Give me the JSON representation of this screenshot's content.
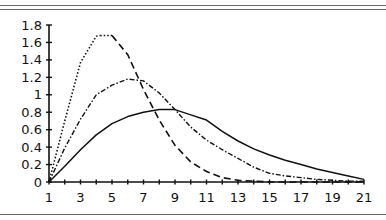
{
  "chart_data": {
    "type": "line",
    "title": "",
    "xlabel": "",
    "ylabel": "",
    "xlim": [
      1,
      21
    ],
    "ylim": [
      0,
      1.8
    ],
    "grid": false,
    "legend": "none",
    "x_ticks": [
      1,
      2,
      3,
      4,
      5,
      6,
      7,
      8,
      9,
      10,
      11,
      12,
      13,
      14,
      15,
      16,
      17,
      18,
      19,
      20,
      21
    ],
    "x_tick_labels": [
      "1",
      "3",
      "5",
      "7",
      "9",
      "11",
      "13",
      "15",
      "17",
      "19",
      "21"
    ],
    "x_tick_label_values": [
      1,
      3,
      5,
      7,
      9,
      11,
      13,
      15,
      17,
      19,
      21
    ],
    "y_tick_labels": [
      "0",
      "0.2",
      "0.4",
      "0.6",
      "0.8",
      "1",
      "1.2",
      "1.4",
      "1.6",
      "1.8"
    ],
    "y_tick_values": [
      0,
      0.2,
      0.4,
      0.6,
      0.8,
      1.0,
      1.2,
      1.4,
      1.6,
      1.8
    ],
    "x": [
      1,
      2,
      3,
      4,
      5,
      6,
      7,
      8,
      9,
      10,
      11,
      12,
      13,
      14,
      15,
      16,
      17,
      18,
      19,
      20,
      21
    ],
    "series": [
      {
        "name": "series-solid",
        "style": "solid",
        "values": [
          0,
          0.18,
          0.37,
          0.54,
          0.67,
          0.75,
          0.8,
          0.83,
          0.83,
          0.77,
          0.71,
          0.58,
          0.47,
          0.38,
          0.31,
          0.25,
          0.2,
          0.15,
          0.11,
          0.07,
          0.03
        ]
      },
      {
        "name": "series-dash-dot",
        "style": "dash-dot",
        "values": [
          0,
          0.39,
          0.72,
          1.0,
          1.11,
          1.18,
          1.16,
          1.02,
          0.83,
          0.63,
          0.48,
          0.37,
          0.27,
          0.17,
          0.1,
          0.07,
          0.05,
          0.03,
          0.02,
          0.01,
          0.01
        ]
      },
      {
        "name": "series-dashed-peak",
        "style": "dotted-rise-dashed-fall",
        "values": [
          0,
          0.7,
          1.37,
          1.67,
          1.68,
          1.46,
          1.06,
          0.71,
          0.42,
          0.23,
          0.12,
          0.05,
          0.02,
          0.01,
          0,
          0,
          0,
          0,
          0,
          0,
          0
        ]
      }
    ]
  }
}
